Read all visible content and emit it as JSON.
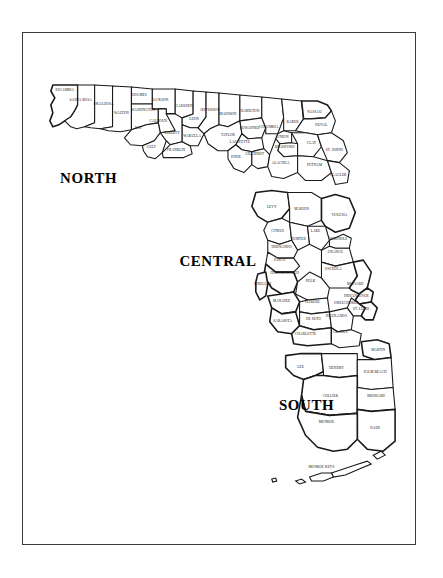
{
  "map": {
    "title": "Florida Counties by Region",
    "frame": {
      "border_color": "#3a3a3a",
      "background": "#ffffff"
    },
    "stroke_color": "#1a1a1a",
    "fill_color": "#ffffff"
  },
  "regions": [
    {
      "id": "north",
      "label": "NORTH",
      "x": 88,
      "y": 182
    },
    {
      "id": "central",
      "label": "CENTRAL",
      "x": 218,
      "y": 266
    },
    {
      "id": "south",
      "label": "SOUTH",
      "x": 307,
      "y": 411
    }
  ],
  "counties": [
    {
      "name": "ESCAMBIA",
      "region": "north",
      "x": 64,
      "y": 90
    },
    {
      "name": "SANTA ROSA",
      "region": "north",
      "x": 80,
      "y": 100
    },
    {
      "name": "OKALOOSA",
      "region": "north",
      "x": 103,
      "y": 104
    },
    {
      "name": "WALTON",
      "region": "north",
      "x": 121,
      "y": 113
    },
    {
      "name": "HOLMES",
      "region": "north",
      "x": 139,
      "y": 95
    },
    {
      "name": "JACKSON",
      "region": "north",
      "x": 160,
      "y": 100
    },
    {
      "name": "WASHINGTON",
      "region": "north",
      "x": 143,
      "y": 110
    },
    {
      "name": "CALHOUN",
      "region": "north",
      "x": 158,
      "y": 121
    },
    {
      "name": "BAY",
      "region": "north",
      "x": 138,
      "y": 128
    },
    {
      "name": "GULF",
      "region": "north",
      "x": 151,
      "y": 147
    },
    {
      "name": "LIBERTY",
      "region": "north",
      "x": 172,
      "y": 133
    },
    {
      "name": "FRANKLIN",
      "region": "north",
      "x": 176,
      "y": 150
    },
    {
      "name": "GADSDEN",
      "region": "north",
      "x": 184,
      "y": 106
    },
    {
      "name": "LEON",
      "region": "north",
      "x": 194,
      "y": 119
    },
    {
      "name": "WAKULLA",
      "region": "north",
      "x": 192,
      "y": 136
    },
    {
      "name": "JEFFERSON",
      "region": "north",
      "x": 210,
      "y": 110
    },
    {
      "name": "MADISON",
      "region": "north",
      "x": 228,
      "y": 114
    },
    {
      "name": "TAYLOR",
      "region": "north",
      "x": 228,
      "y": 135
    },
    {
      "name": "HAMILTON",
      "region": "north",
      "x": 250,
      "y": 111
    },
    {
      "name": "SUWANNEE",
      "region": "north",
      "x": 250,
      "y": 128
    },
    {
      "name": "COLUMBIA",
      "region": "north",
      "x": 269,
      "y": 127
    },
    {
      "name": "LAFAYETTE",
      "region": "north",
      "x": 240,
      "y": 142
    },
    {
      "name": "DIXIE",
      "region": "north",
      "x": 236,
      "y": 157
    },
    {
      "name": "GILCHRIST",
      "region": "north",
      "x": 255,
      "y": 154
    },
    {
      "name": "BAKER",
      "region": "north",
      "x": 293,
      "y": 122
    },
    {
      "name": "NASSAU",
      "region": "north",
      "x": 315,
      "y": 112
    },
    {
      "name": "DUVAL",
      "region": "north",
      "x": 322,
      "y": 125
    },
    {
      "name": "UNION",
      "region": "north",
      "x": 283,
      "y": 137
    },
    {
      "name": "BRADFORD",
      "region": "north",
      "x": 285,
      "y": 147
    },
    {
      "name": "CLAY",
      "region": "north",
      "x": 312,
      "y": 143
    },
    {
      "name": "ST. JOHNS",
      "region": "north",
      "x": 335,
      "y": 150
    },
    {
      "name": "ALACHUA",
      "region": "north",
      "x": 281,
      "y": 163
    },
    {
      "name": "PUTNAM",
      "region": "north",
      "x": 315,
      "y": 165
    },
    {
      "name": "FLAGLER",
      "region": "north",
      "x": 339,
      "y": 175
    },
    {
      "name": "LEVY",
      "region": "central",
      "x": 272,
      "y": 208
    },
    {
      "name": "MARION",
      "region": "central",
      "x": 302,
      "y": 210
    },
    {
      "name": "VOLUSIA",
      "region": "central",
      "x": 340,
      "y": 216
    },
    {
      "name": "CITRUS",
      "region": "central",
      "x": 278,
      "y": 232
    },
    {
      "name": "SUMTER",
      "region": "central",
      "x": 299,
      "y": 240
    },
    {
      "name": "LAKE",
      "region": "central",
      "x": 316,
      "y": 232
    },
    {
      "name": "SEMINOLE",
      "region": "central",
      "x": 339,
      "y": 240
    },
    {
      "name": "HERNANDO",
      "region": "central",
      "x": 282,
      "y": 248
    },
    {
      "name": "ORANGE",
      "region": "central",
      "x": 336,
      "y": 253
    },
    {
      "name": "PASCO",
      "region": "central",
      "x": 280,
      "y": 261
    },
    {
      "name": "HILLSBOROUGH",
      "region": "central",
      "x": 285,
      "y": 274
    },
    {
      "name": "OSCEOLA",
      "region": "central",
      "x": 334,
      "y": 270
    },
    {
      "name": "PINELLAS",
      "region": "central",
      "x": 263,
      "y": 285
    },
    {
      "name": "POLK",
      "region": "central",
      "x": 311,
      "y": 282
    },
    {
      "name": "MANATEE",
      "region": "central",
      "x": 282,
      "y": 302
    },
    {
      "name": "HARDEE",
      "region": "central",
      "x": 313,
      "y": 303
    },
    {
      "name": "BREVARD",
      "region": "central",
      "x": 356,
      "y": 285
    },
    {
      "name": "SARASOTA",
      "region": "central",
      "x": 283,
      "y": 322
    },
    {
      "name": "DE SOTO",
      "region": "central",
      "x": 314,
      "y": 320
    },
    {
      "name": "HIGHLANDS",
      "region": "central",
      "x": 337,
      "y": 317
    },
    {
      "name": "INDIAN RIVER",
      "region": "central",
      "x": 357,
      "y": 297
    },
    {
      "name": "OKEECHOBEE",
      "region": "central",
      "x": 347,
      "y": 304
    },
    {
      "name": "ST. LUCIE",
      "region": "central",
      "x": 362,
      "y": 310
    },
    {
      "name": "CHARLOTTE",
      "region": "central",
      "x": 306,
      "y": 335
    },
    {
      "name": "GLADES",
      "region": "central",
      "x": 341,
      "y": 333
    },
    {
      "name": "LEE",
      "region": "south",
      "x": 301,
      "y": 368
    },
    {
      "name": "HENDRY",
      "region": "south",
      "x": 337,
      "y": 369
    },
    {
      "name": "MARTIN",
      "region": "south",
      "x": 379,
      "y": 351
    },
    {
      "name": "PALM BEACH",
      "region": "south",
      "x": 376,
      "y": 373
    },
    {
      "name": "COLLIER",
      "region": "south",
      "x": 331,
      "y": 398
    },
    {
      "name": "BROWARD",
      "region": "south",
      "x": 377,
      "y": 398
    },
    {
      "name": "DADE",
      "region": "south",
      "x": 376,
      "y": 430
    },
    {
      "name": "MONROE",
      "region": "south",
      "x": 327,
      "y": 424
    },
    {
      "name": "MONROE KEYS",
      "region": "south",
      "x": 322,
      "y": 469
    }
  ]
}
